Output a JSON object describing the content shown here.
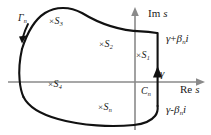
{
  "figure": {
    "type": "complex-plane-contour-diagram",
    "background_color": "#ffffff",
    "axis_color": "#808080",
    "curve_color": "#111111"
  },
  "axes": {
    "real": {
      "label_rm": "Re",
      "label_it": "s",
      "direction": "right"
    },
    "imag": {
      "label_rm": "Im",
      "label_it": "s",
      "direction": "up"
    },
    "origin_px": {
      "x": 135,
      "y": 82
    }
  },
  "contours": [
    {
      "name": "gamma-n-arc",
      "label_it": "Γ",
      "label_sub": "n",
      "label_x": 18,
      "label_y": 13,
      "description": "large left-hand arc of the closed Bromwich contour, traversed counter-clockwise"
    },
    {
      "name": "c-n-segment",
      "label_it": "C",
      "label_sub": "n",
      "label_x": 141,
      "label_y": 86,
      "description": "vertical straight segment at Re s = gamma, traversed upward"
    }
  ],
  "endpoints": [
    {
      "name": "upper-endpoint",
      "it1": "γ",
      "op": "+",
      "it2": "β",
      "sub": "n",
      "it3": "i",
      "x": 166,
      "y": 33
    },
    {
      "name": "lower-endpoint",
      "it1": "γ",
      "op": "-",
      "it2": "β",
      "sub": "n",
      "it3": "i",
      "x": 166,
      "y": 104
    }
  ],
  "gamma_tick": {
    "name": "gamma-on-real-axis",
    "label": "γ",
    "x": 160,
    "y": 68
  },
  "singularities": [
    {
      "name": "s1",
      "cross": "×",
      "sym": "S",
      "sub": "1",
      "x": 136,
      "y": 50
    },
    {
      "name": "s2",
      "cross": "×",
      "sym": "S",
      "sub": "2",
      "x": 99,
      "y": 39
    },
    {
      "name": "s3",
      "cross": "×",
      "sym": "S",
      "sub": "3",
      "x": 49,
      "y": 16
    },
    {
      "name": "s4",
      "cross": "×",
      "sym": "S",
      "sub": "4",
      "x": 48,
      "y": 79
    },
    {
      "name": "sn",
      "cross": "×",
      "sym": "S",
      "sub": "n",
      "x": 98,
      "y": 102
    }
  ]
}
